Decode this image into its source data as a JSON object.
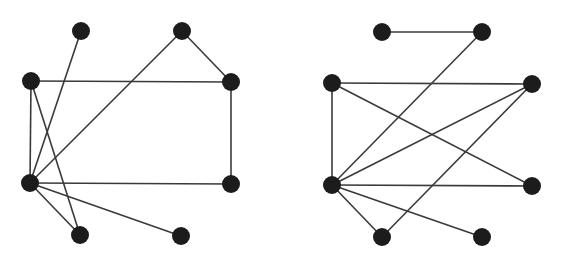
{
  "diagram": {
    "type": "graph-pair",
    "style": {
      "edge_color": "#3a3a3a",
      "node_color": "#1c1c1c",
      "node_radius": 9,
      "background": "#ffffff"
    },
    "graphs": [
      {
        "id": "left-graph",
        "nodes": [
          {
            "id": "A",
            "x": 81,
            "y": 31
          },
          {
            "id": "B",
            "x": 182,
            "y": 31
          },
          {
            "id": "C",
            "x": 31,
            "y": 81
          },
          {
            "id": "D",
            "x": 231,
            "y": 82
          },
          {
            "id": "E",
            "x": 30,
            "y": 183
          },
          {
            "id": "F",
            "x": 231,
            "y": 184
          },
          {
            "id": "G",
            "x": 80,
            "y": 235
          },
          {
            "id": "H",
            "x": 181,
            "y": 236
          }
        ],
        "edges": [
          [
            "A",
            "E"
          ],
          [
            "B",
            "E"
          ],
          [
            "B",
            "D"
          ],
          [
            "C",
            "D"
          ],
          [
            "C",
            "E"
          ],
          [
            "C",
            "G"
          ],
          [
            "D",
            "F"
          ],
          [
            "E",
            "F"
          ],
          [
            "E",
            "G"
          ],
          [
            "E",
            "H"
          ]
        ]
      },
      {
        "id": "right-graph",
        "nodes": [
          {
            "id": "A",
            "x": 382,
            "y": 32
          },
          {
            "id": "B",
            "x": 482,
            "y": 32
          },
          {
            "id": "C",
            "x": 332,
            "y": 83
          },
          {
            "id": "D",
            "x": 532,
            "y": 84
          },
          {
            "id": "E",
            "x": 332,
            "y": 185
          },
          {
            "id": "F",
            "x": 532,
            "y": 186
          },
          {
            "id": "G",
            "x": 382,
            "y": 237
          },
          {
            "id": "H",
            "x": 482,
            "y": 237
          }
        ],
        "edges": [
          [
            "A",
            "B"
          ],
          [
            "B",
            "E"
          ],
          [
            "C",
            "D"
          ],
          [
            "C",
            "E"
          ],
          [
            "C",
            "F"
          ],
          [
            "D",
            "E"
          ],
          [
            "D",
            "G"
          ],
          [
            "E",
            "F"
          ],
          [
            "E",
            "G"
          ],
          [
            "E",
            "H"
          ]
        ]
      }
    ]
  }
}
